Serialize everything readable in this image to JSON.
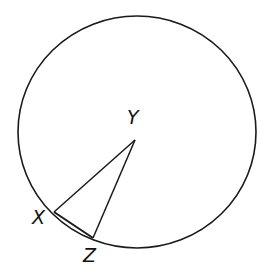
{
  "diagram": {
    "type": "circle-geometry",
    "circle": {
      "cx": 137,
      "cy": 132,
      "rx": 119,
      "ry": 116,
      "stroke": "#1a1a1a"
    },
    "points": [
      {
        "label": "Y",
        "x": 135,
        "y": 140,
        "label_x": 127,
        "label_y": 108
      },
      {
        "label": "X",
        "x": 54,
        "y": 212,
        "label_x": 32,
        "label_y": 210
      },
      {
        "label": "Z",
        "x": 93,
        "y": 238,
        "label_x": 83,
        "label_y": 248
      }
    ],
    "segments": [
      [
        "Y",
        "X"
      ],
      [
        "Y",
        "Z"
      ],
      [
        "X",
        "Z"
      ]
    ]
  }
}
